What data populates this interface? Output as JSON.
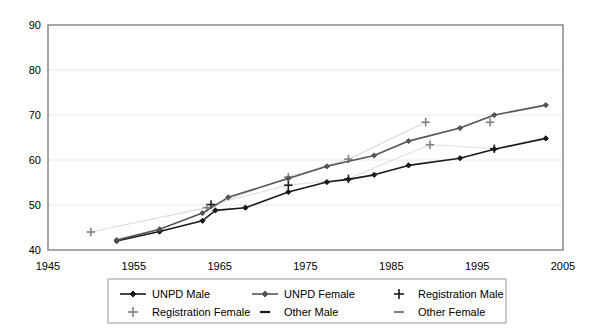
{
  "chart_data": {
    "type": "line",
    "title": "",
    "xlabel": "",
    "ylabel": "",
    "xlim": [
      1945,
      2005
    ],
    "ylim": [
      40,
      90
    ],
    "xticks": [
      1945,
      1955,
      1965,
      1975,
      1985,
      1995,
      2005
    ],
    "yticks": [
      40,
      50,
      60,
      70,
      80,
      90
    ],
    "grid": "horizontal",
    "legend_position": "bottom",
    "series": [
      {
        "name": "UNPD Male",
        "marker": "diamond",
        "line": "solid",
        "color": "#1a1a1a",
        "points": [
          {
            "x": 1953,
            "y": 42.0
          },
          {
            "x": 1958,
            "y": 44.1
          },
          {
            "x": 1963,
            "y": 46.5
          },
          {
            "x": 1964.5,
            "y": 48.8
          },
          {
            "x": 1968,
            "y": 49.4
          },
          {
            "x": 1973,
            "y": 52.9
          },
          {
            "x": 1977.5,
            "y": 55.1
          },
          {
            "x": 1980,
            "y": 55.7
          },
          {
            "x": 1983,
            "y": 56.7
          },
          {
            "x": 1987,
            "y": 58.8
          },
          {
            "x": 1993,
            "y": 60.4
          },
          {
            "x": 1997,
            "y": 62.4
          },
          {
            "x": 2003,
            "y": 64.8
          }
        ]
      },
      {
        "name": "UNPD Female",
        "marker": "diamond",
        "line": "solid",
        "color": "#555555",
        "points": [
          {
            "x": 1953,
            "y": 42.2
          },
          {
            "x": 1958,
            "y": 44.6
          },
          {
            "x": 1963,
            "y": 48.2
          },
          {
            "x": 1966,
            "y": 51.7
          },
          {
            "x": 1973,
            "y": 55.9
          },
          {
            "x": 1977.5,
            "y": 58.6
          },
          {
            "x": 1983,
            "y": 61.0
          },
          {
            "x": 1987,
            "y": 64.2
          },
          {
            "x": 1993,
            "y": 67.1
          },
          {
            "x": 1997,
            "y": 70.0
          },
          {
            "x": 2003,
            "y": 72.2
          }
        ]
      }
    ],
    "scatter": [
      {
        "name": "Registration Male",
        "marker": "plus",
        "color": "#1a1a1a",
        "points": [
          {
            "x": 1964,
            "y": 50.1
          },
          {
            "x": 1973,
            "y": 54.4
          },
          {
            "x": 1980,
            "y": 55.8
          },
          {
            "x": 1997,
            "y": 62.5
          }
        ]
      },
      {
        "name": "Registration Female",
        "marker": "plus",
        "color": "#808080",
        "points": [
          {
            "x": 1950,
            "y": 44.0
          },
          {
            "x": 1963.5,
            "y": 49.4
          },
          {
            "x": 1973,
            "y": 56.2
          },
          {
            "x": 1980,
            "y": 60.2
          },
          {
            "x": 1989,
            "y": 68.4
          },
          {
            "x": 1989.5,
            "y": 63.4
          },
          {
            "x": 1996.5,
            "y": 68.4
          }
        ]
      },
      {
        "name": "Other Male",
        "marker": "dash",
        "color": "#1a1a1a",
        "points": []
      },
      {
        "name": "Other Female",
        "marker": "dash",
        "color": "#808080",
        "points": []
      }
    ],
    "faint_lines": [
      {
        "name": "Other Female trend",
        "color": "#dcdcdc",
        "points": [
          {
            "x": 1950,
            "y": 44.0
          },
          {
            "x": 1963.5,
            "y": 49.4
          },
          {
            "x": 1973,
            "y": 56.2
          },
          {
            "x": 1980,
            "y": 60.2
          },
          {
            "x": 1989,
            "y": 68.4
          }
        ]
      },
      {
        "name": "Other Male trend",
        "color": "#e2e2e2",
        "points": [
          {
            "x": 1964,
            "y": 50.1
          },
          {
            "x": 1973,
            "y": 54.4
          },
          {
            "x": 1980,
            "y": 55.8
          },
          {
            "x": 1989.5,
            "y": 63.4
          },
          {
            "x": 1997,
            "y": 62.5
          }
        ]
      }
    ]
  },
  "legend": {
    "items": [
      {
        "label": "UNPD Male",
        "marker": "line-diamond",
        "color": "#1a1a1a"
      },
      {
        "label": "UNPD Female",
        "marker": "line-diamond",
        "color": "#555555"
      },
      {
        "label": "Registration Male",
        "marker": "plus",
        "color": "#1a1a1a"
      },
      {
        "label": "Registration Female",
        "marker": "plus",
        "color": "#808080"
      },
      {
        "label": "Other Male",
        "marker": "dash",
        "color": "#1a1a1a"
      },
      {
        "label": "Other Female",
        "marker": "dash",
        "color": "#808080"
      }
    ]
  },
  "colors": {
    "background": "#ffffff",
    "plot_border": "#808080",
    "gridline": "#e8e8e8",
    "text": "#000000",
    "legend_border": "#999999"
  }
}
